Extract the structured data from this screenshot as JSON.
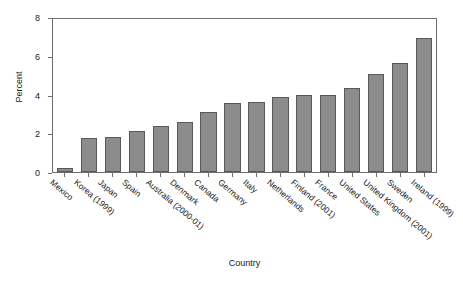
{
  "chart_data": {
    "type": "bar",
    "title": "",
    "xlabel": "Country",
    "ylabel": "Percent",
    "ylim": [
      0,
      8
    ],
    "yticks": [
      0,
      2,
      4,
      6,
      8
    ],
    "grid": false,
    "legend": "none",
    "bar_color": "#8c8c8c",
    "bar_edge_color": "#595959",
    "categories": [
      "Mexico",
      "Korea (1999)",
      "Japan",
      "Spain",
      "Australia (2000-01)",
      "Denmark",
      "Canada",
      "Germany",
      "Italy",
      "Netherlands",
      "Finland (2001)",
      "France",
      "United States",
      "United Kingdom (2001)",
      "Sweden",
      "Ireland (1999)"
    ],
    "values": [
      0.2,
      1.75,
      1.8,
      2.1,
      2.35,
      2.6,
      3.1,
      3.55,
      3.6,
      3.85,
      4.0,
      4.0,
      4.35,
      5.05,
      5.65,
      6.9
    ]
  }
}
